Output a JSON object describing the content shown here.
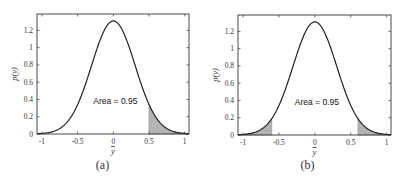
{
  "chart_data": [
    {
      "type": "area",
      "caption": "(a)",
      "title": "",
      "xlabel": "y",
      "ylabel": "p(y)",
      "xlim": [
        -1.07,
        1.06
      ],
      "ylim": [
        0,
        1.39
      ],
      "xticks": [
        -1,
        -0.5,
        0,
        0.5,
        1
      ],
      "xtick_labels": [
        "-1",
        "-0.5",
        "0",
        "0.5",
        "1"
      ],
      "yticks": [
        0,
        0.2,
        0.4,
        0.6,
        0.8,
        1,
        1.2
      ],
      "ytick_labels": [
        "0",
        "0.2",
        "0.4",
        "0.6",
        "0.8",
        "1",
        "1.2"
      ],
      "grid": false,
      "curve": {
        "distribution": "normal",
        "mean": 0,
        "std": 0.305,
        "peak": 1.31
      },
      "x": [
        -1,
        -0.8,
        -0.6,
        -0.4,
        -0.2,
        0,
        0.2,
        0.4,
        0.6,
        0.8,
        1
      ],
      "y": [
        0.006,
        0.042,
        0.19,
        0.55,
        1.06,
        1.31,
        1.06,
        0.55,
        0.19,
        0.042,
        0.006
      ],
      "shaded_regions": [
        [
          0.5,
          1.06
        ]
      ],
      "shade_color": "#b4b4b4",
      "annotation": "Area = 0.95"
    },
    {
      "type": "area",
      "caption": "(b)",
      "title": "",
      "xlabel": "y",
      "ylabel": "p(y)",
      "xlim": [
        -1.07,
        1.06
      ],
      "ylim": [
        0,
        1.39
      ],
      "xticks": [
        -1,
        -0.5,
        0,
        0.5,
        1
      ],
      "xtick_labels": [
        "-1",
        "-0.5",
        "0",
        "0.5",
        "1"
      ],
      "yticks": [
        0,
        0.2,
        0.4,
        0.6,
        0.8,
        1,
        1.2
      ],
      "ytick_labels": [
        "0",
        "0.2",
        "0.4",
        "0.6",
        "0.8",
        "1",
        "1.2"
      ],
      "grid": false,
      "curve": {
        "distribution": "normal",
        "mean": 0,
        "std": 0.305,
        "peak": 1.31
      },
      "x": [
        -1,
        -0.8,
        -0.6,
        -0.4,
        -0.2,
        0,
        0.2,
        0.4,
        0.6,
        0.8,
        1
      ],
      "y": [
        0.006,
        0.042,
        0.19,
        0.55,
        1.06,
        1.31,
        1.06,
        0.55,
        0.19,
        0.042,
        0.006
      ],
      "shaded_regions": [
        [
          -1.07,
          -0.6
        ],
        [
          0.6,
          1.06
        ]
      ],
      "shade_color": "#b4b4b4",
      "annotation": "Area = 0.95"
    }
  ]
}
